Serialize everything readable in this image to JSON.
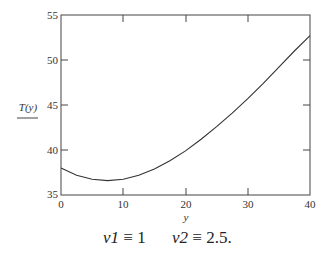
{
  "chart_data": {
    "type": "line",
    "title": "",
    "xlabel": "y",
    "ylabel": "T(y)",
    "xlim": [
      0,
      40
    ],
    "ylim": [
      35,
      55
    ],
    "x_ticks": [
      "0",
      "10",
      "20",
      "30",
      "40"
    ],
    "y_ticks": [
      "35",
      "40",
      "45",
      "50",
      "55"
    ],
    "grid": false,
    "series": [
      {
        "name": "T(y)",
        "x": [
          0,
          2.5,
          5,
          7.5,
          10,
          12.5,
          15,
          17.5,
          20,
          22.5,
          25,
          27.5,
          30,
          32.5,
          35,
          37.5,
          40
        ],
        "values": [
          38.0,
          37.2,
          36.75,
          36.6,
          36.75,
          37.2,
          37.9,
          38.8,
          39.9,
          41.2,
          42.6,
          44.1,
          45.7,
          47.4,
          49.2,
          51.0,
          52.7
        ]
      }
    ]
  },
  "labels": {
    "ylabel": "T(y)",
    "xlabel": "y",
    "x_ticks": [
      "0",
      "10",
      "20",
      "30",
      "40"
    ],
    "y_ticks": [
      "35",
      "40",
      "45",
      "50",
      "55"
    ]
  },
  "formula": {
    "v1_name": "v1",
    "v1_op": "≡",
    "v1_value": "1",
    "v2_name": "v2",
    "v2_op": "≡",
    "v2_value": "2.5."
  }
}
